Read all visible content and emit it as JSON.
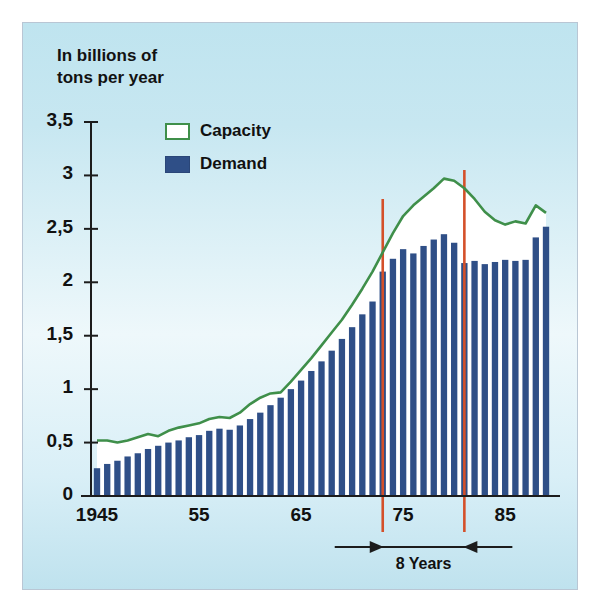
{
  "figure": {
    "axis_title": "In billions of\ntons per year",
    "background_color": "#c7e7f1",
    "border_color": "#b9c6d4"
  },
  "legend": {
    "position": "top-left-inside",
    "items": [
      {
        "key": "capacity",
        "label": "Capacity",
        "fill": "#ffffff",
        "stroke": "#3f8f4a"
      },
      {
        "key": "demand",
        "label": "Demand",
        "fill": "#2f4f87",
        "stroke": "#2a4678"
      }
    ]
  },
  "annotations": {
    "span_label": "8 Years",
    "marker_color": "#d4502a",
    "marker_years": [
      1973,
      1981
    ]
  },
  "axes": {
    "y_ticks": [
      "0",
      "0,5",
      "1",
      "1,5",
      "2",
      "2,5",
      "3",
      "3,5"
    ],
    "x_ticks": [
      "1945",
      "55",
      "65",
      "75",
      "85"
    ]
  },
  "chart_data": {
    "type": "bar",
    "title": "",
    "subtitle": "",
    "xlabel": "",
    "ylabel": "In billions of tons per year",
    "ylim": [
      0,
      3.5
    ],
    "xlim": [
      1945,
      1989
    ],
    "grid": false,
    "legend_position": "upper left",
    "x": [
      1945,
      1946,
      1947,
      1948,
      1949,
      1950,
      1951,
      1952,
      1953,
      1954,
      1955,
      1956,
      1957,
      1958,
      1959,
      1960,
      1961,
      1962,
      1963,
      1964,
      1965,
      1966,
      1967,
      1968,
      1969,
      1970,
      1971,
      1972,
      1973,
      1974,
      1975,
      1976,
      1977,
      1978,
      1979,
      1980,
      1981,
      1982,
      1983,
      1984,
      1985,
      1986,
      1987,
      1988,
      1989
    ],
    "categories": [
      "1945",
      "1946",
      "1947",
      "1948",
      "1949",
      "1950",
      "1951",
      "1952",
      "1953",
      "1954",
      "1955",
      "1956",
      "1957",
      "1958",
      "1959",
      "1960",
      "1961",
      "1962",
      "1963",
      "1964",
      "1965",
      "1966",
      "1967",
      "1968",
      "1969",
      "1970",
      "1971",
      "1972",
      "1973",
      "1974",
      "1975",
      "1976",
      "1977",
      "1978",
      "1979",
      "1980",
      "1981",
      "1982",
      "1983",
      "1984",
      "1985",
      "1986",
      "1987",
      "1988",
      "1989"
    ],
    "series": [
      {
        "name": "Demand",
        "type": "bar",
        "color": "#2f4f87",
        "values": [
          0.26,
          0.3,
          0.33,
          0.37,
          0.4,
          0.44,
          0.47,
          0.5,
          0.52,
          0.55,
          0.57,
          0.61,
          0.63,
          0.62,
          0.66,
          0.72,
          0.78,
          0.85,
          0.92,
          1.0,
          1.08,
          1.17,
          1.26,
          1.36,
          1.47,
          1.58,
          1.7,
          1.82,
          2.1,
          2.22,
          2.31,
          2.27,
          2.34,
          2.4,
          2.45,
          2.37,
          2.18,
          2.2,
          2.17,
          2.19,
          2.21,
          2.2,
          2.21,
          2.42,
          2.52
        ]
      },
      {
        "name": "Capacity",
        "type": "line",
        "color": "#3f8f4a",
        "values": [
          0.52,
          0.52,
          0.5,
          0.52,
          0.55,
          0.58,
          0.56,
          0.61,
          0.64,
          0.66,
          0.68,
          0.72,
          0.74,
          0.73,
          0.78,
          0.86,
          0.92,
          0.96,
          0.97,
          1.07,
          1.18,
          1.29,
          1.41,
          1.53,
          1.65,
          1.79,
          1.94,
          2.1,
          2.28,
          2.46,
          2.62,
          2.72,
          2.8,
          2.88,
          2.97,
          2.95,
          2.88,
          2.78,
          2.66,
          2.58,
          2.54,
          2.57,
          2.55,
          2.72,
          2.65
        ]
      }
    ],
    "annotations": [
      {
        "type": "vline",
        "x": 1973,
        "color": "#d4502a",
        "y_top": 2.78
      },
      {
        "type": "vline",
        "x": 1981,
        "color": "#d4502a",
        "y_top": 3.05
      },
      {
        "type": "span_arrow",
        "x_from": 1973,
        "x_to": 1981,
        "label": "8 Years"
      }
    ]
  }
}
